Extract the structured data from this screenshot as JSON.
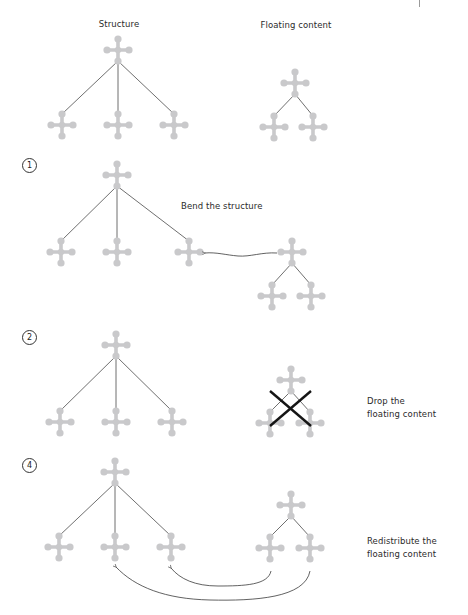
{
  "colors": {
    "node": "#c9c9cb",
    "edge": "#4a4a4a",
    "arrow": "#3a3a3a",
    "cross": "#151515",
    "text": "#2b2b2b"
  },
  "headers": {
    "structure": "Structure",
    "floating": "Floating content"
  },
  "steps": [
    {
      "number": "1",
      "label": "Bend the structure"
    },
    {
      "number": "2",
      "label_line1": "Drop the",
      "label_line2": "floating content"
    },
    {
      "number": "4",
      "label_line1": "Redistribute the",
      "label_line2": "floating content"
    }
  ],
  "icons": {
    "node": "plus-node-icon",
    "cross": "x-mark-icon",
    "arrow": "curved-arrow-icon"
  },
  "diagram": {
    "panels": [
      {
        "id": "overview",
        "structure": {
          "root": [
            118,
            50
          ],
          "children": [
            [
              62,
              125
            ],
            [
              118,
              125
            ],
            [
              174,
              125
            ]
          ]
        },
        "floating": {
          "root": [
            295,
            83
          ],
          "children": [
            [
              274,
              127
            ],
            [
              313,
              127
            ]
          ]
        }
      },
      {
        "id": "bend",
        "structure": {
          "root": [
            117,
            175
          ],
          "children": [
            [
              61,
              252
            ],
            [
              117,
              252
            ],
            [
              189,
              252
            ]
          ]
        },
        "floating": {
          "root": [
            292,
            252
          ],
          "children": [
            [
              272,
              296
            ],
            [
              311,
              296
            ]
          ]
        },
        "arrows": [
          {
            "path": "M277,253 C262,252 250,257 238,256 C226,255 216,252 205,253",
            "head": [
              205,
              253
            ]
          }
        ]
      },
      {
        "id": "drop",
        "structure": {
          "root": [
            116,
            345
          ],
          "children": [
            [
              60,
              422
            ],
            [
              116,
              422
            ],
            [
              172,
              422
            ]
          ]
        },
        "floating": {
          "root": [
            291,
            380
          ],
          "children": [
            [
              270,
              423
            ],
            [
              310,
              423
            ]
          ]
        },
        "cross": [
          [
            270,
            391,
            311,
            426
          ],
          [
            311,
            391,
            270,
            426
          ]
        ]
      },
      {
        "id": "redistribute",
        "structure": {
          "root": [
            115,
            472
          ],
          "children": [
            [
              59,
              547
            ],
            [
              115,
              547
            ],
            [
              171,
              547
            ]
          ]
        },
        "floating": {
          "root": [
            291,
            505
          ],
          "children": [
            [
              270,
              548
            ],
            [
              310,
              548
            ]
          ]
        },
        "arrows": [
          {
            "path": "M271,571 C268,585 245,586 218,586 C195,586 180,579 171,568",
            "head": [
              171,
              568
            ]
          },
          {
            "path": "M310,571 C305,598 255,601 210,600 C165,599 135,587 116,567",
            "head": [
              116,
              567
            ]
          }
        ]
      }
    ]
  }
}
